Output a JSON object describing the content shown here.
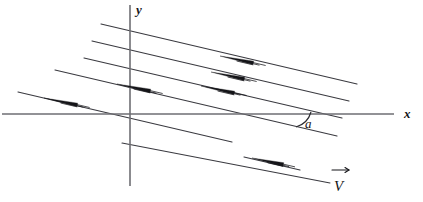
{
  "figure": {
    "background_color": "#ffffff",
    "width": 423,
    "height": 202,
    "line_color": "#3a3a40",
    "axis_color": "#6e6e73",
    "arrow_color": "#141418"
  },
  "axes": {
    "origin": {
      "x": 130,
      "y": 114
    },
    "x_axis": {
      "label": "x",
      "label_x": 404,
      "label_y": 118,
      "x1": 2,
      "y1": 114,
      "x2": 394,
      "y2": 114
    },
    "y_axis": {
      "label": "y",
      "label_x": 136,
      "label_y": 14,
      "x1": 130,
      "y1": 5,
      "x2": 130,
      "y2": 186
    }
  },
  "angle": {
    "label": "a",
    "label_x": 305,
    "label_y": 128,
    "vertex_x": 292,
    "vertex_y": 121,
    "arc_path": "M 311 112 A 22 22 0 0 1 296 127"
  },
  "vector_label": {
    "text": "V",
    "text_x": 334,
    "text_y": 191,
    "arrow_bar_path": "M 332 170 L 349 170",
    "arrow_tip_path": "M 349 170 L 345 167.5 M 349 170 L 345 172.5"
  },
  "flow_lines": [
    {
      "id": "line-1",
      "x1": 101,
      "y1": 24,
      "x2": 357,
      "y2": 84,
      "arrow_at": 0.52
    },
    {
      "id": "line-2",
      "x1": 92,
      "y1": 41,
      "x2": 349,
      "y2": 101,
      "arrow_at": 0.52
    },
    {
      "id": "line-3",
      "x1": 84,
      "y1": 58,
      "x2": 342,
      "y2": 118,
      "arrow_at": 0.47
    },
    {
      "id": "line-4",
      "x1": 55,
      "y1": 70,
      "x2": 337,
      "y2": 136,
      "arrow_at": 0.38
    },
    {
      "id": "line-5",
      "x1": 18,
      "y1": 92,
      "x2": 232,
      "y2": 142,
      "arrow_at": 0.22
    },
    {
      "id": "line-6",
      "x1": 122,
      "y1": 143,
      "x2": 330,
      "y2": 183,
      "arrow_at": 0.0
    },
    {
      "id": "line-7",
      "x1": 244,
      "y1": 157,
      "x2": 300,
      "y2": 170,
      "arrow_at": 0.48
    }
  ],
  "arrow_marks": [
    {
      "id": "arrow-line-1",
      "tip_x": 220,
      "tip_y": 56,
      "len": 34
    },
    {
      "id": "arrow-line-2",
      "tip_x": 211,
      "tip_y": 72,
      "len": 34
    },
    {
      "id": "arrow-line-3",
      "tip_x": 201,
      "tip_y": 86,
      "len": 34
    },
    {
      "id": "arrow-line-4",
      "tip_x": 117,
      "tip_y": 84,
      "len": 34
    },
    {
      "id": "arrow-line-5",
      "tip_x": 44,
      "tip_y": 98,
      "len": 34
    },
    {
      "id": "arrow-line-7",
      "tip_x": 252,
      "tip_y": 158,
      "len": 32
    }
  ]
}
